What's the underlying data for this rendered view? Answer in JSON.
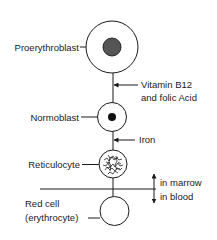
{
  "diagram": {
    "stages": [
      {
        "label": "Proerythroblast"
      },
      {
        "label": "Normoblast"
      },
      {
        "label": "Reticulocyte"
      },
      {
        "label_line1": "Red cell",
        "label_line2": "(erythrocyte)"
      }
    ],
    "factors": [
      {
        "label_line1": "Vitamin B12",
        "label_line2": "and folic Acid"
      },
      {
        "label": "Iron"
      }
    ],
    "boundary": {
      "above": "in marrow",
      "below": "in blood"
    }
  }
}
